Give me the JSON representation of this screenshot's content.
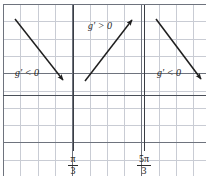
{
  "figure": {
    "type": "sign-chart-number-line-diagram",
    "background_color": "#ffffff"
  },
  "grid": {
    "minor_color": "#c9ccd4",
    "major_color": "#6e737d",
    "axis_color": "#4a4f58",
    "cell_size_px": 17.3,
    "left_px": 3,
    "top_px": 4,
    "right_px": 206,
    "bottom_px": 176,
    "x_axis_y_px": 95,
    "show_minor": true,
    "show_major": true
  },
  "vertical_lines": [
    {
      "name": "asymptote-pi-over-3",
      "x_px": 73,
      "top_px": 5,
      "bottom_px": 151,
      "color": "#3a3d44"
    },
    {
      "name": "asymptote-5pi-over-3",
      "x_px": 144,
      "top_px": 5,
      "bottom_px": 151,
      "color": "#3a3d44"
    }
  ],
  "tick_labels": [
    {
      "name": "tick-pi-over-3",
      "numerator": "π",
      "denominator": "3",
      "x_px": 73,
      "y_px": 154
    },
    {
      "name": "tick-5pi-over-3",
      "numerator": "5π",
      "denominator": "3",
      "x_px": 144,
      "y_px": 154
    }
  ],
  "arrows": [
    {
      "name": "arrow-left-decreasing",
      "x1": 15,
      "y1": 19,
      "x2": 63,
      "y2": 80,
      "color": "#1f1f1f",
      "direction": "down-right"
    },
    {
      "name": "arrow-middle-increasing",
      "x1": 85,
      "y1": 81,
      "x2": 132,
      "y2": 20,
      "color": "#1f1f1f",
      "direction": "up-right"
    },
    {
      "name": "arrow-right-decreasing",
      "x1": 156,
      "y1": 19,
      "x2": 201,
      "y2": 79,
      "color": "#1f1f1f",
      "direction": "down-right"
    }
  ],
  "region_labels": [
    {
      "name": "label-left-negative",
      "function": "g′",
      "operator": "<",
      "value": "0",
      "text": "g′ < 0",
      "x_px": 15,
      "y_px": 67
    },
    {
      "name": "label-middle-positive",
      "function": "g′",
      "operator": ">",
      "value": "0",
      "text": "g′ > 0",
      "x_px": 88,
      "y_px": 20
    },
    {
      "name": "label-right-negative",
      "function": "g′",
      "operator": "<",
      "value": "0",
      "text": "g′ < 0",
      "x_px": 157,
      "y_px": 67
    }
  ],
  "chart_data": {
    "type": "line",
    "title": "",
    "xlabel": "",
    "ylabel": "",
    "grid": true,
    "legend": "none",
    "x_tick_labels": [
      "π/3",
      "5π/3"
    ],
    "x_tick_positions_px": [
      73,
      144
    ],
    "intervals": [
      {
        "region": "left",
        "label": "g′ < 0",
        "sign": "negative",
        "slope": "decreasing"
      },
      {
        "region": "middle",
        "label": "g′ > 0",
        "sign": "positive",
        "slope": "increasing"
      },
      {
        "region": "right",
        "label": "g′ < 0",
        "sign": "negative",
        "slope": "decreasing"
      }
    ],
    "series": [
      {
        "name": "arrow-left-decreasing",
        "x": [
          15,
          63
        ],
        "y": [
          19,
          80
        ]
      },
      {
        "name": "arrow-middle-increasing",
        "x": [
          85,
          132
        ],
        "y": [
          81,
          20
        ]
      },
      {
        "name": "arrow-right-decreasing",
        "x": [
          156,
          201
        ],
        "y": [
          19,
          79
        ]
      }
    ]
  }
}
